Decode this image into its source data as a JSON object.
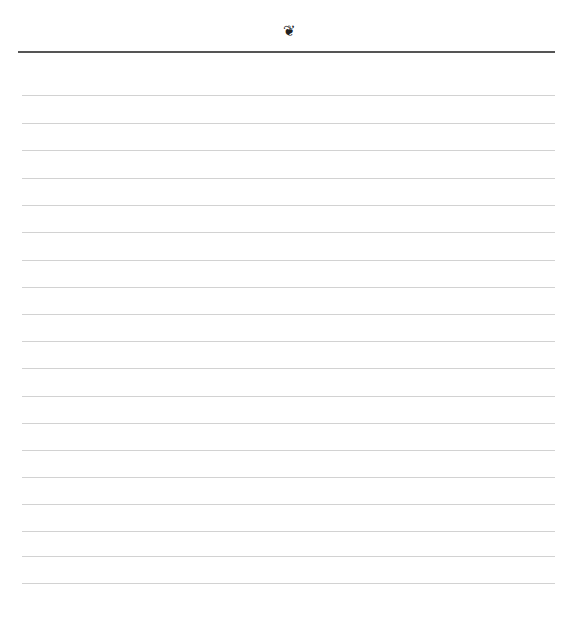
{
  "page": {
    "ornament_icon": "❦",
    "line_count": 19,
    "line_positions": [
      95,
      123,
      150,
      178,
      205,
      232,
      260,
      287,
      314,
      341,
      368,
      396,
      423,
      450,
      477,
      504,
      531,
      556,
      583
    ]
  }
}
